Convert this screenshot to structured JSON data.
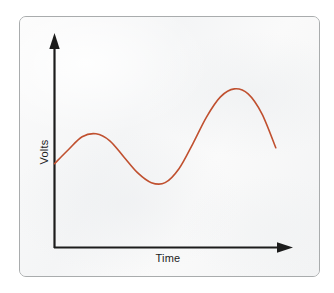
{
  "figure": {
    "frame_border_color": "#a9acad",
    "background_color": "#f7f8f8",
    "axis_color": "#1c1c1c",
    "curve_color": "#c0502f",
    "y_axis_label": "Volts",
    "x_axis_label": "Time"
  },
  "chart_data": {
    "type": "line",
    "title": "",
    "subtitle": "",
    "xlabel": "Time",
    "ylabel": "Volts",
    "grid": false,
    "legend": false,
    "legend_position": "none",
    "axis_style": "arrow-axes",
    "xlim": [
      0,
      10
    ],
    "ylim": [
      0,
      10
    ],
    "x_tick_labels": [],
    "y_tick_labels": [],
    "series": [
      {
        "name": "Volts",
        "color": "#c0502f",
        "line_width": 1.6,
        "x": [
          0.0,
          0.6,
          1.2,
          1.8,
          2.4,
          3.0,
          3.6,
          4.2,
          4.8,
          5.4,
          6.0,
          6.6,
          7.2,
          7.8,
          8.4,
          9.0,
          9.6
        ],
        "y": [
          4.2,
          4.9,
          5.55,
          5.7,
          5.35,
          4.55,
          3.75,
          3.25,
          3.25,
          3.95,
          5.2,
          6.55,
          7.55,
          7.95,
          7.7,
          6.7,
          5.0
        ]
      }
    ],
    "annotations": [
      {
        "label": "start on y-axis",
        "x": 0.0,
        "y": 4.2
      },
      {
        "label": "first local maximum",
        "x": 1.65,
        "y": 5.72
      },
      {
        "label": "local minimum",
        "x": 4.45,
        "y": 3.22
      },
      {
        "label": "global maximum",
        "x": 8.0,
        "y": 7.98
      },
      {
        "label": "end of trace",
        "x": 9.6,
        "y": 5.0
      }
    ]
  }
}
